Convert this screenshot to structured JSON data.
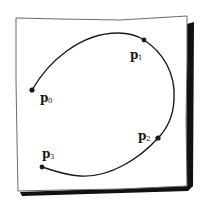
{
  "diagram": {
    "style": "hand-drawn",
    "colors": {
      "ink": "#1a1a1a",
      "paper": "#ffffff",
      "frame": "#6b6b6b",
      "shadow": "#111111"
    },
    "points": [
      {
        "id": "p0",
        "letter": "p",
        "sub": "0",
        "label": "p0"
      },
      {
        "id": "p1",
        "letter": "p",
        "sub": "1",
        "label": "p1"
      },
      {
        "id": "p2",
        "letter": "p",
        "sub": "2",
        "label": "p2"
      },
      {
        "id": "p3",
        "letter": "p",
        "sub": "3",
        "label": "p3"
      }
    ],
    "curve": {
      "description": "smooth open curve from p0 over the top through p1, down the right side through p2, ending at p3",
      "passes_through": [
        "p0",
        "p1",
        "p2",
        "p3"
      ]
    }
  }
}
